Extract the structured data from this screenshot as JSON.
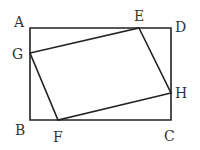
{
  "figure": {
    "type": "geometry",
    "outer_shape": {
      "name": "ABCD",
      "vertices": [
        "A",
        "B",
        "C",
        "D"
      ]
    },
    "inner_shape": {
      "name": "EFGH",
      "vertices": [
        "E",
        "H",
        "F",
        "G"
      ]
    },
    "point_labels": {
      "A": "A",
      "B": "B",
      "C": "C",
      "D": "D",
      "E": "E",
      "F": "F",
      "G": "G",
      "H": "H"
    },
    "points_on_sides": {
      "E": "AD",
      "F": "BC",
      "G": "AB",
      "H": "DC"
    },
    "colors": {
      "line": "#222222",
      "label": "#333333",
      "background": "#ffffff"
    }
  }
}
